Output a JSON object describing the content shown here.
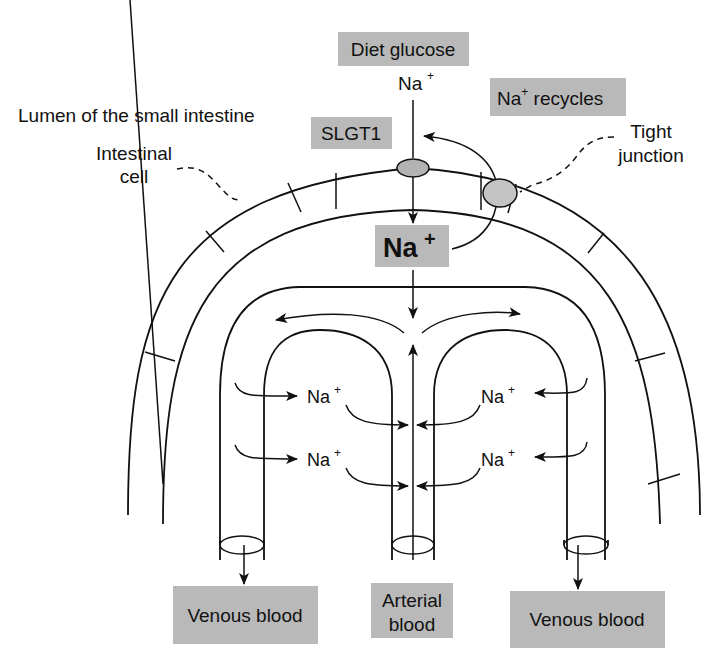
{
  "diagram": {
    "colors": {
      "box_fill": "#b9b9b9",
      "ellipse_fill": "#b3b3b3",
      "line": "#111111",
      "background": "#ffffff"
    },
    "labels": {
      "diet_glucose": "Diet glucose",
      "na_entry": "Na",
      "na_entry_sup": "+",
      "na_recycles_prefix": "Na",
      "na_recycles_sup": "+",
      "na_recycles_suffix": " recycles",
      "slgt1": "SLGT1",
      "lumen": "Lumen of the small intestine",
      "intestinal_cell_line1": "Intestinal",
      "intestinal_cell_line2": "cell",
      "tight_junction_line1": "Tight",
      "tight_junction_line2": "junction",
      "na_big": "Na",
      "na_big_sup": "+",
      "venous_left": "Venous blood",
      "venous_right": "Venous blood",
      "arterial_line1": "Arterial",
      "arterial_line2": "blood"
    },
    "capillary_ions": [
      {
        "id": "left-upper",
        "text": "Na",
        "sup": "+"
      },
      {
        "id": "right-upper",
        "text": "Na",
        "sup": "+"
      },
      {
        "id": "left-lower",
        "text": "Na",
        "sup": "+"
      },
      {
        "id": "right-lower",
        "text": "Na",
        "sup": "+"
      }
    ],
    "components": {
      "transporter": "SLGT1 ellipse",
      "junction": "tight junction ellipse",
      "vessels": [
        "left venous capillary",
        "central arterial capillary",
        "right venous capillary"
      ]
    }
  }
}
